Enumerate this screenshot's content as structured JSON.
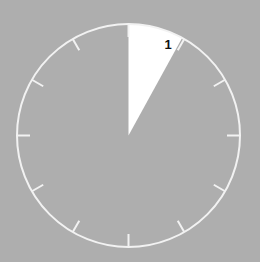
{
  "figure": {
    "background_color": "#aeaeae",
    "width": 260,
    "height": 262
  },
  "dial": {
    "center_x": 128.5,
    "center_y": 135.5,
    "radius": 111.5,
    "rim_color": "#f2f2f2",
    "rim_width": 2,
    "tick_count": 12,
    "tick_length": 13,
    "tick_color": "#f2f2f2",
    "tick_width": 2,
    "tick_angles_deg": [
      0,
      30,
      60,
      90,
      120,
      150,
      180,
      210,
      240,
      270,
      300,
      330
    ]
  },
  "chart_data": {
    "type": "pie",
    "title": "",
    "xlabel": "",
    "ylabel": "",
    "start_angle_deg": 0,
    "direction": "clockwise",
    "total_degrees": 360,
    "categories": [
      "1",
      "rest"
    ],
    "values": [
      8,
      92
    ],
    "slices": [
      {
        "label": "1",
        "value": 8,
        "start_deg": 0,
        "end_deg": 28.8,
        "color": "#ffffff",
        "label_color": "#111111",
        "label_x": 168,
        "label_y": 46,
        "visible": true
      },
      {
        "label": "rest",
        "value": 92,
        "start_deg": 28.8,
        "end_deg": 360,
        "color": "#aeaeae",
        "visible": false
      }
    ],
    "legend": [],
    "legend_position": "none",
    "grid": false
  }
}
